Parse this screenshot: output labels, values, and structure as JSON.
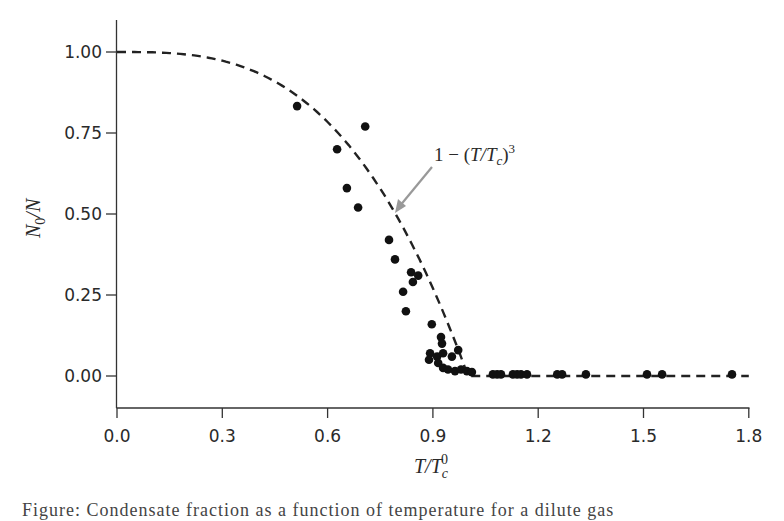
{
  "chart_data": {
    "type": "scatter",
    "title": "",
    "xlabel": "T/T_c^0",
    "ylabel": "N_0/N",
    "xlim": [
      0.0,
      1.8
    ],
    "ylim": [
      -0.09,
      1.09
    ],
    "x_ticks": [
      "0.0",
      "0.3",
      "0.6",
      "0.9",
      "1.2",
      "1.5",
      "1.8"
    ],
    "y_ticks": [
      "0.00",
      "0.25",
      "0.50",
      "0.75",
      "1.00"
    ],
    "grid": false,
    "legend": null,
    "series": [
      {
        "name": "Measured condensate fraction",
        "kind": "scatter",
        "marker": "filled-circle",
        "color": "#111111",
        "x": [
          0.513,
          0.627,
          0.655,
          0.687,
          0.707,
          0.775,
          0.792,
          0.815,
          0.823,
          0.838,
          0.843,
          0.858,
          0.897,
          0.923,
          0.926,
          0.892,
          0.889,
          0.912,
          0.929,
          0.954,
          0.972,
          0.915,
          0.929,
          0.943,
          0.963,
          0.98,
          0.997,
          1.011,
          1.071,
          1.083,
          1.094,
          1.128,
          1.14,
          1.151,
          1.168,
          1.254,
          1.268,
          1.336,
          1.51,
          1.553,
          1.752
        ],
        "y": [
          0.833,
          0.7,
          0.58,
          0.52,
          0.77,
          0.42,
          0.36,
          0.26,
          0.2,
          0.32,
          0.29,
          0.31,
          0.16,
          0.12,
          0.1,
          0.07,
          0.05,
          0.06,
          0.07,
          0.06,
          0.08,
          0.04,
          0.025,
          0.02,
          0.015,
          0.02,
          0.015,
          0.012,
          0.005,
          0.005,
          0.005,
          0.005,
          0.005,
          0.005,
          0.005,
          0.005,
          0.005,
          0.005,
          0.005,
          0.005,
          0.005
        ]
      },
      {
        "name": "1 - (T/T_c)^3",
        "kind": "line",
        "style": "dashed",
        "color": "#222222",
        "formula": "y = 1 - x^3 for x < 1; y = 0 for x >= 1",
        "x_range": [
          0.0,
          1.8
        ]
      }
    ],
    "annotations": [
      {
        "text": "1 − (T/T_c)^3",
        "arrow_color": "#999999",
        "points_to": [
          0.79,
          0.5
        ]
      }
    ]
  },
  "labels": {
    "xlabel_main": "T/T",
    "xlabel_sub": "c",
    "xlabel_sup": "0",
    "ylabel_main": "N",
    "ylabel_sub": "0",
    "ylabel_tail": "/N",
    "annotation_prefix": "1 − (",
    "annotation_mid": "T/T",
    "annotation_sub": "c",
    "annotation_close": ")",
    "annotation_sup": "3"
  },
  "caption": {
    "text": "Figure: Condensate fraction as a function of temperature for a dilute gas"
  }
}
